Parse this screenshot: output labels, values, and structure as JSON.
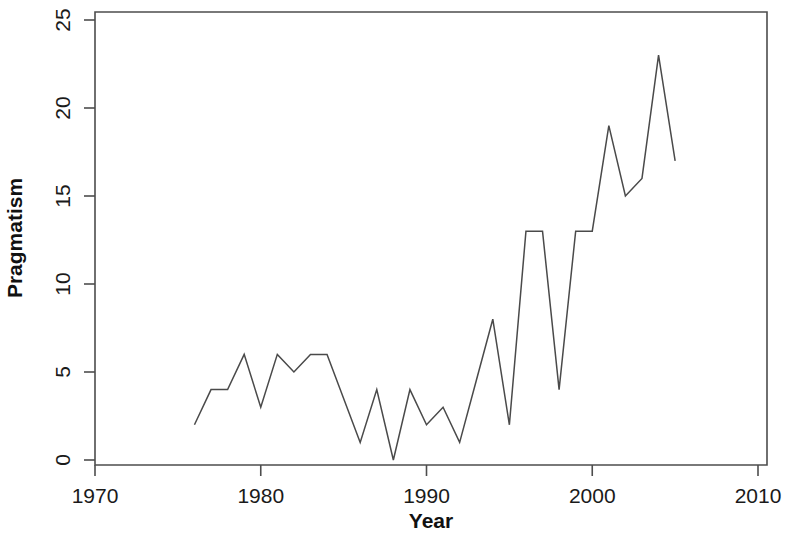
{
  "chart_data": {
    "type": "line",
    "title": "",
    "xlabel": "Year",
    "ylabel": "Pragmatism",
    "xlim": [
      1968,
      2011
    ],
    "ylim": [
      0,
      25.6
    ],
    "xticks": [
      1970,
      1980,
      1990,
      2000,
      2010
    ],
    "xtick_labels": [
      "1970",
      "1980",
      "1990",
      "2000",
      "2010"
    ],
    "yticks": [
      0,
      5,
      10,
      15,
      20,
      25
    ],
    "ytick_labels": [
      "0",
      "5",
      "10",
      "15",
      "20",
      "25"
    ],
    "grid": false,
    "legend": false,
    "line_color": "#4a4a4a",
    "frame_color": "#4d4d4d",
    "x": [
      1976,
      1977,
      1978,
      1979,
      1980,
      1981,
      1982,
      1983,
      1984,
      1985,
      1986,
      1987,
      1988,
      1989,
      1990,
      1991,
      1992,
      1993,
      1994,
      1995,
      1996,
      1997,
      1998,
      1999,
      2000,
      2001,
      2002,
      2003,
      2004,
      2005
    ],
    "values": [
      2,
      4,
      4,
      6,
      3,
      6,
      5,
      6,
      6,
      3.5,
      1,
      4,
      0,
      4,
      2,
      3,
      1,
      4.5,
      8,
      2,
      13,
      13,
      4,
      13,
      13,
      19,
      15,
      16,
      23,
      17
    ]
  },
  "axes": {
    "x_title": "Year",
    "y_title": "Pragmatism"
  }
}
